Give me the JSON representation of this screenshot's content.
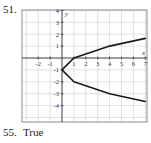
{
  "problem": {
    "number": "51."
  },
  "answer": {
    "number": "55.",
    "text": "True"
  },
  "colors": {
    "grid": "#cfcfcf",
    "frame": "#8a8a8a",
    "axis": "#3a3a3a",
    "curve": "#1a1a1a"
  },
  "chart_data": {
    "type": "line",
    "title": "",
    "xlabel": "x",
    "ylabel": "y",
    "xlim": [
      -3,
      7
    ],
    "ylim": [
      -5,
      4
    ],
    "grid": true,
    "x_ticks": [
      -2,
      -1,
      1,
      2,
      3,
      4,
      5,
      6,
      7
    ],
    "y_ticks": [
      4,
      3,
      2,
      1,
      -1,
      -2,
      -3,
      -4
    ],
    "x_tick_labels": [
      "-2",
      "-1",
      "1",
      "2",
      "3",
      "4",
      "5",
      "6",
      "7"
    ],
    "y_tick_labels": [
      "4",
      "3",
      "2",
      "1",
      "-1",
      "-2",
      "-3",
      "-4"
    ],
    "legend": null,
    "note": "Curve drawn as an eyeball approximation from the screenshot; no equation is printed in the image.",
    "series": [
      {
        "name": "sideways parabola (approximate reproduction)",
        "description": "Opens to the right with vertex near (0, -1); upper branch crosses the x-axis near x = 1. Points are visual estimates.",
        "points": [
          {
            "x": 7,
            "y": 1.65
          },
          {
            "x": 4,
            "y": 1.0
          },
          {
            "x": 1,
            "y": 0.0
          },
          {
            "x": 0,
            "y": -1.0
          },
          {
            "x": 1,
            "y": -2.0
          },
          {
            "x": 4,
            "y": -3.0
          },
          {
            "x": 7,
            "y": -3.65
          }
        ]
      }
    ]
  }
}
